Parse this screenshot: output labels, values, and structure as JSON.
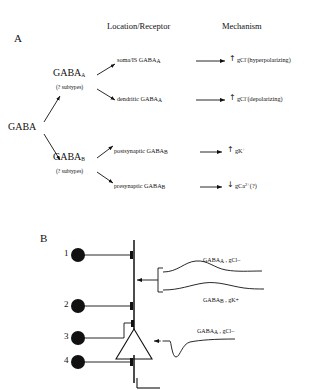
{
  "figure": {
    "panel_a": {
      "letter": "A",
      "headers": {
        "location": "Location/Receptor",
        "mechanism": "Mechanism"
      },
      "root": {
        "label": "GABA"
      },
      "branches": [
        {
          "receptor": "GABA",
          "receptor_sub": "A",
          "subtypes_note": "(? subtypes)",
          "rows": [
            {
              "location": "soma/IS  GABA",
              "location_sub": "A",
              "direction": "up",
              "direction_glyph": "↑",
              "mechanism": "gCl",
              "mechanism_sup": "-",
              "mechanism_note": "(hyperpolarizing)"
            },
            {
              "location": "dendritic GABA",
              "location_sub": "A",
              "direction": "up",
              "direction_glyph": "↑",
              "mechanism": "gCl",
              "mechanism_sup": "-",
              "mechanism_note": "(depolarizing)"
            }
          ]
        },
        {
          "receptor": "GABA",
          "receptor_sub": "B",
          "subtypes_note": "(? subtypes)",
          "rows": [
            {
              "location": "postsynaptic  GABA",
              "location_sub": "B",
              "direction": "up",
              "direction_glyph": "↑",
              "mechanism": "gK",
              "mechanism_sup": "+",
              "mechanism_note": ""
            },
            {
              "location": "presynaptic  GABA",
              "location_sub": "B",
              "direction": "down",
              "direction_glyph": "↓",
              "mechanism": "gCa",
              "mechanism_sup": "2+",
              "mechanism_note": "(?)"
            }
          ]
        }
      ]
    },
    "panel_b": {
      "letter": "B",
      "neurons": [
        {
          "number": "1"
        },
        {
          "number": "2"
        },
        {
          "number": "3"
        },
        {
          "number": "4"
        }
      ],
      "trace_labels": [
        {
          "receptor": "GABA",
          "receptor_sub": "A",
          "separator": " , ",
          "conductance": "gCl–"
        },
        {
          "receptor": "GABA",
          "receptor_sub": "B",
          "separator": " , ",
          "conductance": "gK+"
        },
        {
          "receptor": "GABA",
          "receptor_sub": "A",
          "separator": " , ",
          "conductance": "gCl–"
        }
      ]
    }
  },
  "colors": {
    "ink": "#111111",
    "background": "#ffffff"
  }
}
